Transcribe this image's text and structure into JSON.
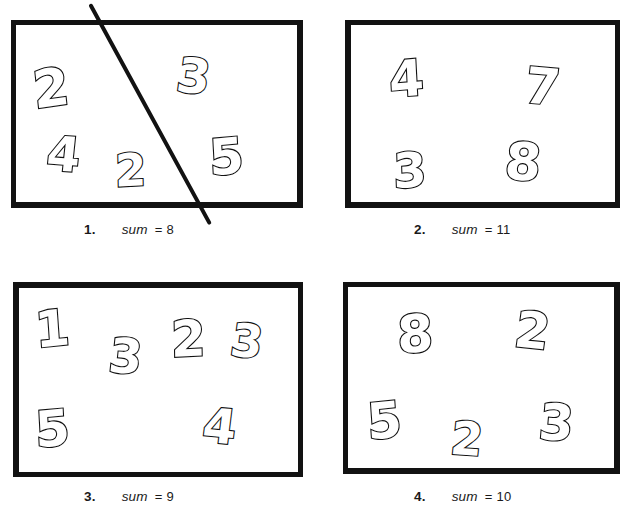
{
  "page": {
    "kind": "math-worksheet",
    "ink_color": "#121212",
    "paper_color": "#ffffff"
  },
  "puzzles": [
    {
      "id": "puzzle-1",
      "index_label": "1.",
      "sum_word": "sum",
      "equals": "=",
      "target_sum": "8",
      "caption_text": "1.     sum = 8",
      "has_drawn_line": true,
      "digits": [
        {
          "value": "2",
          "x": 22,
          "y": 42,
          "size": 52,
          "rotate": -8
        },
        {
          "value": "3",
          "x": 166,
          "y": 32,
          "size": 48,
          "rotate": 6
        },
        {
          "value": "4",
          "x": 36,
          "y": 110,
          "size": 48,
          "rotate": 4
        },
        {
          "value": "2",
          "x": 104,
          "y": 128,
          "size": 45,
          "rotate": -3
        },
        {
          "value": "5",
          "x": 198,
          "y": 112,
          "size": 50,
          "rotate": -5
        }
      ]
    },
    {
      "id": "puzzle-2",
      "index_label": "2.",
      "sum_word": "sum",
      "equals": "=",
      "target_sum": "11",
      "caption_text": "2.     sum = 11",
      "has_drawn_line": false,
      "digits": [
        {
          "value": "4",
          "x": 44,
          "y": 34,
          "size": 50,
          "rotate": -5
        },
        {
          "value": "7",
          "x": 180,
          "y": 42,
          "size": 50,
          "rotate": 5
        },
        {
          "value": "3",
          "x": 48,
          "y": 126,
          "size": 48,
          "rotate": -4
        },
        {
          "value": "8",
          "x": 160,
          "y": 116,
          "size": 52,
          "rotate": 3
        }
      ]
    },
    {
      "id": "puzzle-3",
      "index_label": "3.",
      "sum_word": "sum",
      "equals": "=",
      "target_sum": "9",
      "caption_text": "3.     sum = 9",
      "has_drawn_line": false,
      "digits": [
        {
          "value": "1",
          "x": 22,
          "y": 22,
          "size": 50,
          "rotate": -6
        },
        {
          "value": "3",
          "x": 96,
          "y": 50,
          "size": 48,
          "rotate": 4
        },
        {
          "value": "2",
          "x": 158,
          "y": 32,
          "size": 50,
          "rotate": -3
        },
        {
          "value": "3",
          "x": 218,
          "y": 36,
          "size": 46,
          "rotate": 6
        },
        {
          "value": "5",
          "x": 22,
          "y": 122,
          "size": 50,
          "rotate": -5
        },
        {
          "value": "4",
          "x": 190,
          "y": 120,
          "size": 48,
          "rotate": 5
        }
      ]
    },
    {
      "id": "puzzle-4",
      "index_label": "4.",
      "sum_word": "sum",
      "equals": "=",
      "target_sum": "10",
      "caption_text": "4.     sum = 10",
      "has_drawn_line": false,
      "digits": [
        {
          "value": "8",
          "x": 54,
          "y": 26,
          "size": 52,
          "rotate": -4
        },
        {
          "value": "2",
          "x": 172,
          "y": 24,
          "size": 50,
          "rotate": 6
        },
        {
          "value": "5",
          "x": 24,
          "y": 114,
          "size": 50,
          "rotate": -6
        },
        {
          "value": "2",
          "x": 108,
          "y": 134,
          "size": 46,
          "rotate": 4
        },
        {
          "value": "3",
          "x": 196,
          "y": 116,
          "size": 50,
          "rotate": 3
        }
      ]
    }
  ]
}
